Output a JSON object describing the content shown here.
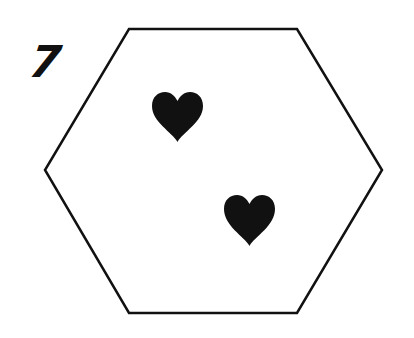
{
  "card": {
    "number": "7",
    "shape": "hexagon",
    "stroke_color": "#111111",
    "fill_color": "#ffffff",
    "symbols": [
      {
        "type": "heart-icon",
        "color": "#111111",
        "count_index": 1
      },
      {
        "type": "heart-icon",
        "color": "#111111",
        "count_index": 2
      }
    ],
    "symbol_count": 2
  }
}
